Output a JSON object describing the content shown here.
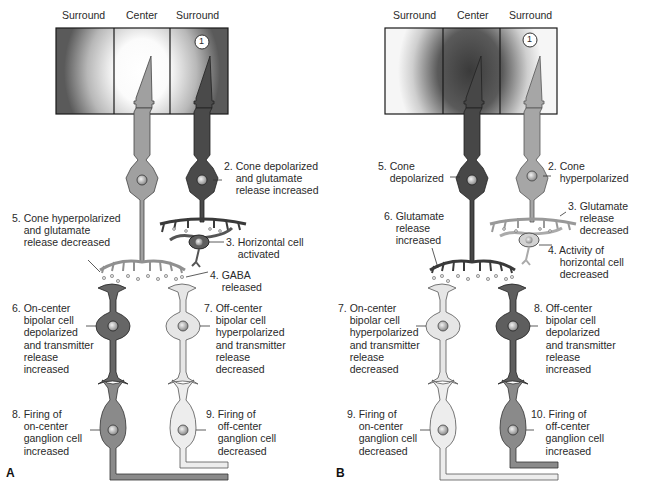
{
  "panels": [
    {
      "id": "A",
      "letter": "A",
      "stimulus": "light in center",
      "headers": {
        "left": "Surround",
        "center": "Center",
        "right": "Surround"
      },
      "step_marker": "1",
      "colors": {
        "center_field": "#ffffff",
        "surround_field": "#5a5a5a",
        "hyperpolarized_cell": "#a9a9a9",
        "depolarized_cell": "#4a4a4a",
        "light_cell": "#e6e6e6"
      },
      "labels": {
        "cone_depolarized": "2. Cone depolarized\n    and glutamate\n    release increased",
        "horizontal_activated": "3. Horizontal cell\n    activated",
        "gaba_released": "4. GABA\n    released",
        "cone_hyperpolarized": "5. Cone hyperpolarized\n    and glutamate\n    release decreased",
        "on_bipolar": "6. On-center\n    bipolar cell\n    depolarized\n    and transmitter\n    release\n    increased",
        "off_bipolar": "7. Off-center\n    bipolar cell\n    hyperpolarized\n    and transmitter\n    release\n    decreased",
        "on_ganglion": "8. Firing of\n    on-center\n    ganglion cell\n    increased",
        "off_ganglion": "9. Firing of\n    off-center\n    ganglion cell\n    decreased"
      }
    },
    {
      "id": "B",
      "letter": "B",
      "stimulus": "dark in center",
      "headers": {
        "left": "Surround",
        "center": "Center",
        "right": "Surround"
      },
      "step_marker": "1",
      "colors": {
        "center_field": "#3c3c3c",
        "surround_field": "#f6f6f6"
      },
      "labels": {
        "cone_hyperpolarized": "2. Cone\n    hyperpolarized",
        "glutamate_decreased": "3. Glutamate\n    release\n    decreased",
        "horizontal_decreased": "4. Activity of\n    horizontal cell\n    decreased",
        "cone_depolarized": "5. Cone\n    depolarized",
        "glutamate_increased": "6. Glutamate\n    release\n    increased",
        "on_bipolar": "7. On-center\n    bipolar cell\n    hyperpolarized\n    and transmitter\n    release\n    decreased",
        "off_bipolar": "8. Off-center\n    bipolar cell\n    depolarized\n    and transmitter\n    release\n    increased",
        "on_ganglion": "9. Firing of\n    on-center\n    ganglion cell\n    decreased",
        "off_ganglion": "10. Firing of\n     off-center\n     ganglion cell\n     increased"
      }
    }
  ]
}
